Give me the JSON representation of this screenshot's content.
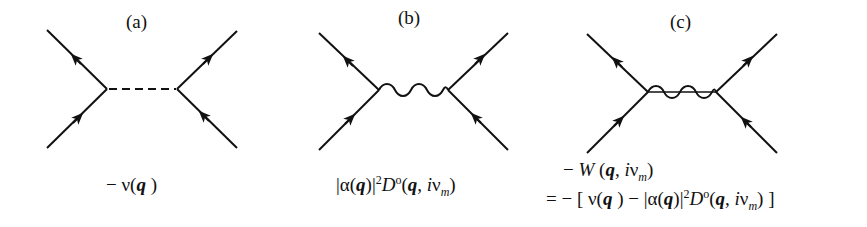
{
  "panels": [
    {
      "label": "(a)",
      "propagator": "dashed",
      "formula": {
        "minus": "−",
        "v": "ν",
        "lp": "(",
        "q": "q",
        "rp": " )"
      }
    },
    {
      "label": "(b)",
      "propagator": "wavy",
      "formula": {
        "bar1": "|",
        "alpha": "α",
        "lp": "(",
        "q": "q",
        "rp": ")",
        "bar2": "|",
        "sq": "2",
        "D": "D",
        "o": "o",
        "lp2": "(",
        "q2": "q",
        "comma": ", ",
        "i": "i",
        "nu": "ν",
        "m": "m",
        "rp2": ")"
      }
    },
    {
      "label": "(c)",
      "propagator": "wavy+dashed",
      "formula_line1": {
        "minus": "− ",
        "W": "W",
        "rest_lp": " (",
        "q": "q",
        "comma": ", ",
        "i": "i",
        "nu": "ν",
        "m": "m",
        "rp": ")"
      },
      "formula_line2": {
        "eq": "= − [ ",
        "v": "ν",
        "lp": "(",
        "q": "q",
        "rp": " ) − ",
        "bar1": "|",
        "alpha": "α",
        "lp2": "(",
        "q2": "q",
        "rp2": ")",
        "bar2": "|",
        "sq": "2",
        "D": "D",
        "o": "o",
        "lp3": "(",
        "q3": "q",
        "comma": ", ",
        "i": "i",
        "nu": "ν",
        "m": "m",
        "rp3": ") ]"
      }
    }
  ]
}
